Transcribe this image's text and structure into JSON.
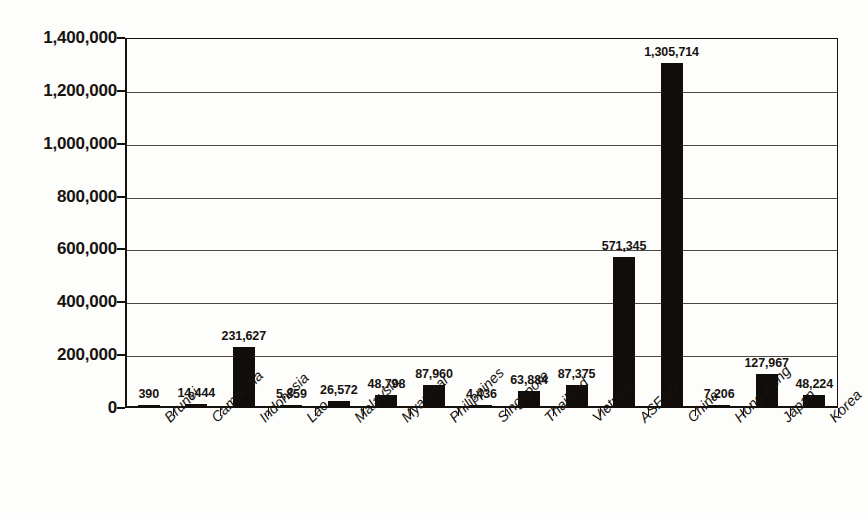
{
  "chart_data": {
    "type": "bar",
    "title": "",
    "subtitle": "",
    "xlabel": "",
    "ylabel": "",
    "ylim": [
      0,
      1400000
    ],
    "grid": true,
    "legend": "none",
    "orientation": "vertical",
    "bar_color": "#100d0a",
    "background_color": "#fdfdfb",
    "axis_color": "#15110d",
    "gridline_color": "#4c4741",
    "y_ticks": [
      0,
      200000,
      400000,
      600000,
      800000,
      1000000,
      1200000,
      1400000
    ],
    "y_tick_labels": [
      "0",
      "200,000",
      "400,000",
      "600,000",
      "800,000",
      "1,000,000",
      "1,200,000",
      "1,400,000"
    ],
    "categories": [
      "Brunei",
      "Cambodia",
      "Indonesia",
      "Lao",
      "Malaysia",
      "Myanmar",
      "Philippines",
      "Singapore",
      "Thailand",
      "Vietnam",
      "ASEAN",
      "China",
      "Hong Kong",
      "Japan",
      "Korea"
    ],
    "values": [
      390,
      14444,
      231627,
      5859,
      26572,
      48798,
      87960,
      4436,
      63884,
      87375,
      571345,
      1305714,
      7206,
      127967,
      48224
    ],
    "value_labels": [
      "390",
      "14,444",
      "231,627",
      "5,859",
      "26,572",
      "48,798",
      "87,960",
      "4,436",
      "63,884",
      "87,375",
      "571,345",
      "1,305,714",
      "7,206",
      "127,967",
      "48,224"
    ]
  }
}
